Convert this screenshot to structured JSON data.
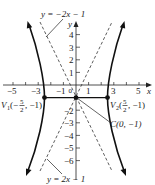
{
  "figure": {
    "type": "hyperbola-graph",
    "equation_implied": "x^2/(25/4) - (y+1)^2/25 = 1",
    "axes": {
      "x_label": "x",
      "y_label": "y",
      "x_ticks": [
        "−5",
        "−3",
        "−1",
        "0",
        "1",
        "3",
        "5"
      ],
      "y_ticks_pos": [
        "1",
        "2",
        "3",
        "4"
      ],
      "y_ticks_neg": [
        "−2",
        "−3",
        "−4",
        "−5",
        "−6"
      ],
      "x_range": [
        -5.8,
        5.8
      ],
      "y_range": [
        -7,
        6
      ]
    },
    "asymptotes": [
      {
        "label": "y = −2x − 1",
        "slope": -2,
        "intercept": -1,
        "style": "dashed"
      },
      {
        "label": "y = 2x − 1",
        "slope": 2,
        "intercept": -1,
        "style": "dashed"
      }
    ],
    "points": [
      {
        "name": "V1",
        "label_prefix": "V",
        "label_sub": "1",
        "label_coords": "(−5/2, −1)",
        "x": -2.5,
        "y": -1
      },
      {
        "name": "V2",
        "label_prefix": "V",
        "label_sub": "2",
        "label_coords": "(5/2, −1)",
        "x": 2.5,
        "y": -1
      },
      {
        "name": "C",
        "label": "C(0, −1)",
        "x": 0,
        "y": -1
      }
    ],
    "labels": {
      "top_asymptote": "y = −2x − 1",
      "bottom_asymptote": "y = 2x − 1",
      "center": "C(0, −1)",
      "v1_prefix": "V",
      "v1_sub": "1",
      "v1_open": "(−",
      "v1_num": "5",
      "v1_den": "2",
      "v1_close": ", −1)",
      "v2_prefix": "V",
      "v2_sub": "2",
      "v2_open": "(",
      "v2_num": "5",
      "v2_den": "2",
      "v2_close": ", −1)"
    },
    "colors": {
      "curve": "#111111",
      "axes": "#222222",
      "background": "#ffffff"
    }
  }
}
